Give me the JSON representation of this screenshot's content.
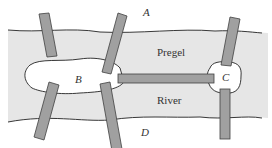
{
  "diagram": {
    "colors": {
      "background": "#ffffff",
      "river": "#e6e6e6",
      "island": "#ffffff",
      "bridge_fill": "#a0a0a0",
      "bridge_stroke": "#404040",
      "outline": "#222222"
    },
    "land_labels": {
      "A": "A",
      "B": "B",
      "C": "C",
      "D": "D"
    },
    "river_labels": {
      "upper": "Pregel",
      "lower": "River"
    },
    "bridges": [
      {
        "id": "bridge-1",
        "connects": [
          "A",
          "B"
        ]
      },
      {
        "id": "bridge-2",
        "connects": [
          "A",
          "B"
        ]
      },
      {
        "id": "bridge-3",
        "connects": [
          "B",
          "D"
        ]
      },
      {
        "id": "bridge-4",
        "connects": [
          "B",
          "D"
        ]
      },
      {
        "id": "bridge-5",
        "connects": [
          "B",
          "C"
        ]
      },
      {
        "id": "bridge-6",
        "connects": [
          "A",
          "C"
        ]
      },
      {
        "id": "bridge-7",
        "connects": [
          "C",
          "D"
        ]
      }
    ]
  }
}
